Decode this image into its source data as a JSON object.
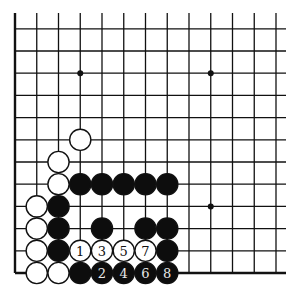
{
  "diagram": {
    "type": "go-board-fragment",
    "background": "#ffffff",
    "line_color": "#111111",
    "grid": {
      "columns": 13,
      "rows": 12,
      "origin_x": 15,
      "bottom_y": 273,
      "col_spacing": 21.75,
      "row_spacing": 22.2,
      "top_extent_y": 13,
      "right_extent_x": 286,
      "left_edge": true,
      "bottom_edge": true
    },
    "star_points": [
      {
        "col": 3,
        "row": 9
      },
      {
        "col": 9,
        "row": 9
      },
      {
        "col": 9,
        "row": 3
      }
    ],
    "stones": [
      {
        "col": 1,
        "row": 0,
        "color": "white",
        "label": ""
      },
      {
        "col": 2,
        "row": 0,
        "color": "white",
        "label": ""
      },
      {
        "col": 3,
        "row": 0,
        "color": "black",
        "label": ""
      },
      {
        "col": 4,
        "row": 0,
        "color": "black",
        "label": "2"
      },
      {
        "col": 5,
        "row": 0,
        "color": "black",
        "label": "4"
      },
      {
        "col": 6,
        "row": 0,
        "color": "black",
        "label": "6"
      },
      {
        "col": 7,
        "row": 0,
        "color": "black",
        "label": "8"
      },
      {
        "col": 1,
        "row": 1,
        "color": "white",
        "label": ""
      },
      {
        "col": 2,
        "row": 1,
        "color": "black",
        "label": ""
      },
      {
        "col": 3,
        "row": 1,
        "color": "white",
        "label": "1"
      },
      {
        "col": 4,
        "row": 1,
        "color": "white",
        "label": "3"
      },
      {
        "col": 5,
        "row": 1,
        "color": "white",
        "label": "5"
      },
      {
        "col": 6,
        "row": 1,
        "color": "white",
        "label": "7"
      },
      {
        "col": 7,
        "row": 1,
        "color": "black",
        "label": ""
      },
      {
        "col": 1,
        "row": 2,
        "color": "white",
        "label": ""
      },
      {
        "col": 2,
        "row": 2,
        "color": "black",
        "label": ""
      },
      {
        "col": 4,
        "row": 2,
        "color": "black",
        "label": ""
      },
      {
        "col": 6,
        "row": 2,
        "color": "black",
        "label": ""
      },
      {
        "col": 7,
        "row": 2,
        "color": "black",
        "label": ""
      },
      {
        "col": 1,
        "row": 3,
        "color": "white",
        "label": ""
      },
      {
        "col": 2,
        "row": 3,
        "color": "black",
        "label": ""
      },
      {
        "col": 2,
        "row": 4,
        "color": "white",
        "label": ""
      },
      {
        "col": 3,
        "row": 4,
        "color": "black",
        "label": ""
      },
      {
        "col": 4,
        "row": 4,
        "color": "black",
        "label": ""
      },
      {
        "col": 5,
        "row": 4,
        "color": "black",
        "label": ""
      },
      {
        "col": 6,
        "row": 4,
        "color": "black",
        "label": ""
      },
      {
        "col": 7,
        "row": 4,
        "color": "black",
        "label": ""
      },
      {
        "col": 2,
        "row": 5,
        "color": "white",
        "label": ""
      },
      {
        "col": 3,
        "row": 6,
        "color": "white",
        "label": ""
      }
    ]
  }
}
